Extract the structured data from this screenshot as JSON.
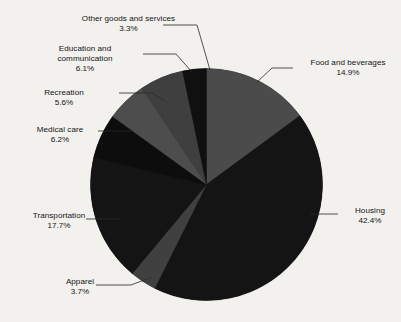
{
  "chart_data": {
    "type": "pie",
    "title": "",
    "subtitle": "",
    "xlabel": "",
    "ylabel": "",
    "legend_position": "none",
    "grid": false,
    "start_angle_deg": 0,
    "direction": "clockwise",
    "units": "percent",
    "categories": [
      "Food and beverages",
      "Housing",
      "Apparel",
      "Transportation",
      "Medical care",
      "Recreation",
      "Education and communication",
      "Other goods and services"
    ],
    "values": [
      14.9,
      42.4,
      3.7,
      17.7,
      6.2,
      5.6,
      6.1,
      3.3
    ],
    "slices": [
      {
        "label": "Food and beverages",
        "value": 14.9,
        "value_text": "14.9%",
        "color": "#4b4b4b"
      },
      {
        "label": "Housing",
        "value": 42.4,
        "value_text": "42.4%",
        "color": "#141414"
      },
      {
        "label": "Apparel",
        "value": 3.7,
        "value_text": "3.7%",
        "color": "#404040"
      },
      {
        "label": "Transportation",
        "value": 17.7,
        "value_text": "17.7%",
        "color": "#141414"
      },
      {
        "label": "Medical care",
        "value": 6.2,
        "value_text": "6.2%",
        "color": "#0d0d0d"
      },
      {
        "label": "Recreation",
        "value": 5.6,
        "value_text": "5.6%",
        "color": "#4d4d4d"
      },
      {
        "label": "Education and communication",
        "value": 6.1,
        "value_text": "6.1%",
        "color": "#3f3f3f"
      },
      {
        "label": "Other goods and services",
        "value": 3.3,
        "value_text": "3.3%",
        "color": "#101010"
      }
    ]
  },
  "labels": {
    "other_goods": {
      "name": "Other goods and services",
      "pct": "3.3%"
    },
    "education": {
      "name_line1": "Education and",
      "name_line2": "communication",
      "pct": "6.1%"
    },
    "recreation": {
      "name": "Recreation",
      "pct": "5.6%"
    },
    "medical": {
      "name": "Medical care",
      "pct": "6.2%"
    },
    "transportation": {
      "name": "Transportation",
      "pct": "17.7%"
    },
    "apparel": {
      "name": "Apparel",
      "pct": "3.7%"
    },
    "housing": {
      "name": "Housing",
      "pct": "42.4%"
    },
    "food": {
      "name": "Food and beverages",
      "pct": "14.9%"
    }
  },
  "style": {
    "background": "#f2f1ee",
    "text_color": "#141414",
    "leader_line_color": "#2a2a2a",
    "slice_gray": "#4b4b4b",
    "slice_black": "#141414"
  }
}
